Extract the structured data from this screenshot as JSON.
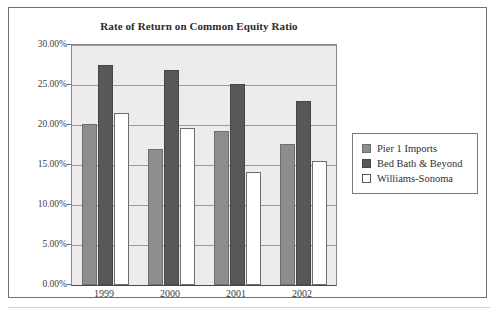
{
  "chart_data": {
    "type": "bar",
    "title": "Rate of Return on Common Equity Ratio",
    "xlabel": "",
    "ylabel": "",
    "categories": [
      "1999",
      "2000",
      "2001",
      "2002"
    ],
    "series": [
      {
        "name": "Pier 1 Imports",
        "color": "#8d8d8d",
        "values": [
          20.1,
          17.0,
          19.3,
          17.6
        ]
      },
      {
        "name": "Bed Bath & Beyond",
        "color": "#585858",
        "values": [
          27.5,
          26.9,
          25.1,
          23.0
        ]
      },
      {
        "name": "Williams-Sonoma",
        "color": "#ffffff",
        "values": [
          21.5,
          19.6,
          14.1,
          15.5
        ]
      }
    ],
    "ylim": [
      0,
      30
    ],
    "y_tick_values": [
      0,
      5,
      10,
      15,
      20,
      25,
      30
    ],
    "y_tick_labels": [
      "0.00%",
      "5.00%",
      "10.00%",
      "15.00%",
      "20.00%",
      "25.00%",
      "30.00%"
    ],
    "value_suffix": "%",
    "grid": true,
    "legend_position": "right",
    "plot_background": "#ececed",
    "figure_background": "#ffffff"
  }
}
